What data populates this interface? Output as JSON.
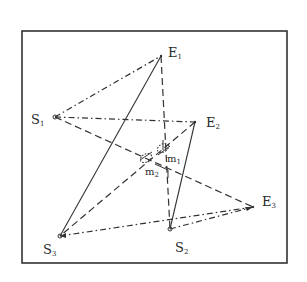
{
  "diagram": {
    "frame": {
      "x": 22,
      "y": 31,
      "width": 265,
      "height": 232,
      "stroke": "#333333"
    },
    "points": {
      "E1": {
        "x": 161,
        "y": 56,
        "label": "E",
        "sub": "1",
        "lx": 168,
        "ly": 57
      },
      "E2": {
        "x": 195,
        "y": 122,
        "label": "E",
        "sub": "2",
        "lx": 206,
        "ly": 127
      },
      "E3": {
        "x": 253,
        "y": 207,
        "label": "E",
        "sub": "3",
        "lx": 262,
        "ly": 206
      },
      "S1": {
        "x": 55,
        "y": 117,
        "label": "S",
        "sub": "1",
        "lx": 31,
        "ly": 124
      },
      "S2": {
        "x": 170,
        "y": 229,
        "label": "S",
        "sub": "2",
        "lx": 175,
        "ly": 252
      },
      "S3": {
        "x": 60,
        "y": 236,
        "label": "S",
        "sub": "3",
        "lx": 43,
        "ly": 254
      },
      "m1": {
        "x": 163,
        "y": 148,
        "label": "m",
        "sub": "1",
        "lx": 167,
        "ly": 162
      },
      "m2": {
        "x": 146,
        "y": 158,
        "label": "m",
        "sub": "2",
        "lx": 145,
        "ly": 175
      }
    },
    "lines": [
      {
        "from": "S1",
        "to": "E1",
        "style": "dashdot"
      },
      {
        "from": "S1",
        "to": "E2",
        "style": "dashdot"
      },
      {
        "from": "S1",
        "to": "E3",
        "style": "dashed"
      },
      {
        "from": "E1",
        "to": "S3",
        "style": "solid"
      },
      {
        "from": "E1",
        "to": "S2",
        "style": "dashed"
      },
      {
        "from": "E2",
        "to": "S2",
        "style": "solid"
      },
      {
        "from": "E2",
        "to": "S3",
        "style": "dashed"
      },
      {
        "from": "S3",
        "to": "E3",
        "style": "dashdot"
      },
      {
        "from": "S2",
        "to": "E3",
        "style": "dashdot"
      }
    ],
    "stroke_color": "#333333"
  }
}
